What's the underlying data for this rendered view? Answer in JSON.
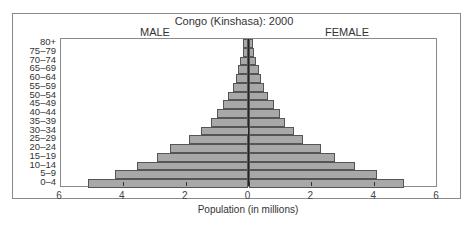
{
  "chart_data": {
    "type": "bar",
    "subtype": "population-pyramid",
    "title": "Congo (Kinshasa): 2000",
    "left_header": "MALE",
    "right_header": "FEMALE",
    "xlabel": "Population (in millions)",
    "ylabel": "",
    "xlim": [
      -6,
      6
    ],
    "xticks": [
      -6,
      -4,
      -2,
      0,
      2,
      4,
      6
    ],
    "xtick_labels": [
      "6",
      "4",
      "2",
      "0",
      "2",
      "4",
      "6"
    ],
    "categories": [
      "0–4",
      "5–9",
      "10–14",
      "15–19",
      "20–24",
      "25–29",
      "30–34",
      "35–39",
      "40–44",
      "45–49",
      "50–54",
      "55–59",
      "60–64",
      "65–69",
      "70–74",
      "75–79",
      "80+"
    ],
    "series": [
      {
        "name": "MALE",
        "values": [
          5.1,
          4.25,
          3.55,
          2.9,
          2.5,
          1.9,
          1.5,
          1.2,
          1.0,
          0.8,
          0.65,
          0.5,
          0.4,
          0.33,
          0.27,
          0.17,
          0.16
        ]
      },
      {
        "name": "FEMALE",
        "values": [
          4.95,
          4.1,
          3.4,
          2.75,
          2.3,
          1.75,
          1.45,
          1.15,
          1.0,
          0.8,
          0.63,
          0.5,
          0.4,
          0.32,
          0.25,
          0.16,
          0.13
        ]
      }
    ],
    "grid": false,
    "legend": "none",
    "colors": {
      "bar_fill": "#a8a8a8",
      "bar_edge": "#555555"
    }
  }
}
